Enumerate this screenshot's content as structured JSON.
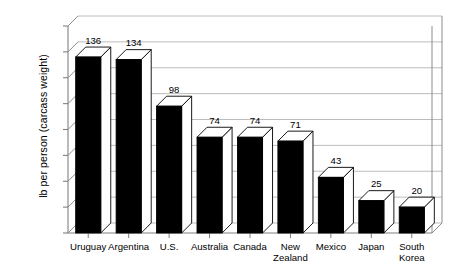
{
  "chart_data": {
    "type": "bar",
    "title": "",
    "subtitle": "",
    "xlabel": "",
    "ylabel": "lb per person (carcass weight)",
    "categories": [
      "Uruguay",
      "Argentina",
      "U.S.",
      "Australia",
      "Canada",
      "New Zealand",
      "Mexico",
      "Japan",
      "South Korea"
    ],
    "values": [
      136,
      134,
      98,
      74,
      74,
      71,
      43,
      25,
      20
    ],
    "data_labels": [
      "136",
      "134",
      "98",
      "74",
      "74",
      "71",
      "43",
      "25",
      "20"
    ],
    "ylim": [
      0,
      160
    ],
    "y_tick_values": [
      0,
      20,
      40,
      60,
      80,
      100,
      120,
      140,
      160
    ],
    "y_tick_labels_shown": false,
    "grid": true,
    "grid_orientation": "horizontal",
    "legend": false,
    "legend_position": "none",
    "style": "3d-bars",
    "bar_face_color": "#000000",
    "bar_top_color": "#ffffff",
    "bar_side_color": "#ffffff",
    "bar_outline_color": "#000000",
    "grid_color": "#b4b4b4",
    "axis_color": "#808080",
    "background_color": "#ffffff"
  },
  "axis": {
    "y_title": "lb per person (carcass weight)"
  },
  "category_labels": [
    {
      "line1": "Uruguay",
      "line2": ""
    },
    {
      "line1": "Argentina",
      "line2": ""
    },
    {
      "line1": "U.S.",
      "line2": ""
    },
    {
      "line1": "Australia",
      "line2": ""
    },
    {
      "line1": "Canada",
      "line2": ""
    },
    {
      "line1": "New",
      "line2": "Zealand"
    },
    {
      "line1": "Mexico",
      "line2": ""
    },
    {
      "line1": "Japan",
      "line2": ""
    },
    {
      "line1": "South",
      "line2": "Korea"
    }
  ]
}
